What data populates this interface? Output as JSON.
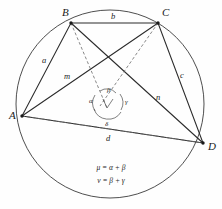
{
  "figure": {
    "vertices": [
      {
        "name": "A",
        "label": "A",
        "x": 22,
        "y": 116,
        "label_x": 9,
        "label_y": 119
      },
      {
        "name": "B",
        "label": "B",
        "x": 71,
        "y": 23,
        "label_x": 62,
        "label_y": 16
      },
      {
        "name": "C",
        "label": "C",
        "x": 158,
        "y": 23,
        "label_x": 162,
        "label_y": 16
      },
      {
        "name": "D",
        "label": "D",
        "x": 203,
        "y": 143,
        "label_x": 208,
        "label_y": 150
      }
    ],
    "sides": [
      {
        "name": "side-ab",
        "label": "a",
        "x": 42,
        "y": 63
      },
      {
        "name": "side-bc",
        "label": "b",
        "x": 111,
        "y": 19
      },
      {
        "name": "side-cd",
        "label": "c",
        "x": 180,
        "y": 78
      },
      {
        "name": "side-ad",
        "label": "d",
        "x": 106,
        "y": 141
      }
    ],
    "diagonals": [
      {
        "name": "diagonal-ac",
        "label": "m",
        "x": 64,
        "y": 79
      },
      {
        "name": "diagonal-bd",
        "label": "n",
        "x": 156,
        "y": 100
      }
    ],
    "angles": [
      {
        "name": "angle-alpha",
        "label": "α",
        "x": 92,
        "y": 102
      },
      {
        "name": "angle-beta",
        "label": "β",
        "x": 110,
        "y": 92
      },
      {
        "name": "angle-gamma",
        "label": "γ",
        "x": 126,
        "y": 103
      },
      {
        "name": "angle-delta",
        "label": "δ",
        "x": 108,
        "y": 124
      }
    ],
    "equations": [
      {
        "name": "equation-mu",
        "text": "μ = α + β"
      },
      {
        "name": "equation-nu",
        "text": "ν = β + γ"
      }
    ],
    "intersection": {
      "x": 107,
      "y": 101
    },
    "circle": {
      "cx": 110,
      "cy": 104,
      "r": 94
    },
    "colors": {
      "background": "#fefefe",
      "line": "#2b2b2b",
      "circle": "#3a3a3a",
      "dashed": "#6a6a6a",
      "text": "#1a1a1a"
    }
  }
}
